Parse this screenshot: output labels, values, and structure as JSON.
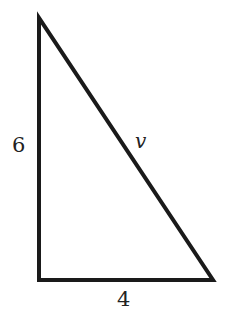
{
  "diagram": {
    "type": "right-triangle",
    "stroke_color": "#1a1a1a",
    "background": "#ffffff",
    "vertices": {
      "top": [
        39,
        18
      ],
      "bottom_left": [
        39,
        280
      ],
      "bottom_right": [
        213,
        280
      ]
    },
    "labels": {
      "vertical_side": "6",
      "horizontal_side": "4",
      "hypotenuse": "v"
    }
  }
}
